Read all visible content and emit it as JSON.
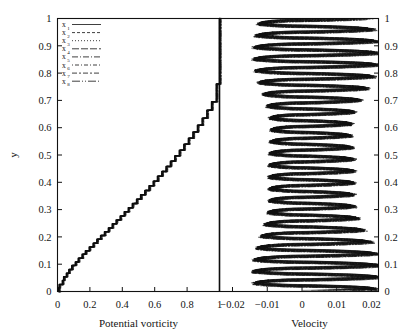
{
  "figure": {
    "y_axis_label": "y",
    "left_panel": {
      "x_axis_label": "Potential vorticity",
      "x_ticks": [
        "0",
        "0.2",
        "0.4",
        "0.6",
        "0.8",
        "1"
      ],
      "x_tick_values": [
        0,
        0.2,
        0.4,
        0.6,
        0.8,
        1
      ]
    },
    "right_panel": {
      "x_axis_label": "Velocity",
      "x_ticks": [
        "−0.02",
        "−0.01",
        "0",
        "0.01",
        "0.02"
      ],
      "x_tick_values": [
        -0.02,
        -0.01,
        0,
        0.01,
        0.02
      ]
    },
    "y_ticks": [
      "0",
      "0.1",
      "0.2",
      "0.3",
      "0.4",
      "0.5",
      "0.6",
      "0.7",
      "0.8",
      "0.9",
      "1"
    ],
    "y_tick_values": [
      0,
      0.1,
      0.2,
      0.3,
      0.4,
      0.5,
      0.6,
      0.7,
      0.8,
      0.9,
      1
    ]
  },
  "legend": {
    "entries": [
      {
        "label": "x",
        "sub": "1",
        "dash": "none"
      },
      {
        "label": "x",
        "sub": "2",
        "dash": "3,2"
      },
      {
        "label": "x",
        "sub": "3",
        "dash": "1,2"
      },
      {
        "label": "x",
        "sub": "4",
        "dash": "7,2"
      },
      {
        "label": "x",
        "sub": "5",
        "dash": "6,2,1,2"
      },
      {
        "label": "x",
        "sub": "6",
        "dash": "1,2,4,2"
      },
      {
        "label": "x",
        "sub": "7",
        "dash": "5,2,2,2"
      },
      {
        "label": "x",
        "sub": "8",
        "dash": "8,2,1,2,1,2"
      }
    ]
  },
  "chart_data": {
    "type": "line",
    "title": "",
    "panels": [
      {
        "name": "potential-vorticity",
        "xlabel": "Potential vorticity",
        "ylabel": "y",
        "xlim": [
          0,
          1
        ],
        "ylim": [
          0,
          1
        ],
        "grid": false,
        "description": "Monotonic staircase profile rising from near 0 at y=0 to 1 at y=1, with a small hook near the origin; superposed curves for x1..x8 nearly coincide.",
        "series": [
          {
            "name": "x1..x8 (coincident staircase)",
            "x": [
              0.012,
              0.006,
              0.004,
              0.01,
              0.022,
              0.03,
              0.031,
              0.038,
              0.046,
              0.055,
              0.06,
              0.07,
              0.08,
              0.088,
              0.098,
              0.11,
              0.12,
              0.128,
              0.14,
              0.152,
              0.162,
              0.172,
              0.185,
              0.196,
              0.208,
              0.22,
              0.23,
              0.243,
              0.255,
              0.266,
              0.278,
              0.29,
              0.302,
              0.314,
              0.326,
              0.338,
              0.35,
              0.362,
              0.374,
              0.387,
              0.399,
              0.412,
              0.424,
              0.437,
              0.45,
              0.462,
              0.475,
              0.488,
              0.5,
              0.513,
              0.526,
              0.539,
              0.552,
              0.565,
              0.578,
              0.591,
              0.604,
              0.617,
              0.63,
              0.644,
              0.657,
              0.67,
              0.684,
              0.697,
              0.711,
              0.724,
              0.738,
              0.752,
              0.766,
              0.78,
              0.794,
              0.808,
              0.822,
              0.836,
              0.85,
              0.864,
              0.879,
              0.893,
              0.908,
              0.922,
              0.937,
              0.951,
              0.966,
              0.98,
              0.993,
              1.0
            ],
            "y": [
              0.0,
              0.006,
              0.013,
              0.02,
              0.026,
              0.033,
              0.04,
              0.047,
              0.054,
              0.06,
              0.067,
              0.074,
              0.081,
              0.088,
              0.095,
              0.101,
              0.108,
              0.115,
              0.122,
              0.129,
              0.136,
              0.142,
              0.149,
              0.156,
              0.163,
              0.17,
              0.177,
              0.184,
              0.191,
              0.198,
              0.205,
              0.212,
              0.219,
              0.226,
              0.233,
              0.24,
              0.248,
              0.255,
              0.262,
              0.269,
              0.277,
              0.284,
              0.292,
              0.299,
              0.307,
              0.315,
              0.322,
              0.33,
              0.338,
              0.346,
              0.354,
              0.362,
              0.37,
              0.379,
              0.387,
              0.396,
              0.404,
              0.413,
              0.422,
              0.431,
              0.44,
              0.449,
              0.458,
              0.468,
              0.477,
              0.487,
              0.497,
              0.507,
              0.517,
              0.528,
              0.539,
              0.55,
              0.561,
              0.572,
              0.584,
              0.596,
              0.609,
              0.622,
              0.635,
              0.649,
              0.664,
              0.679,
              0.695,
              0.713,
              0.76,
              1.0
            ]
          }
        ],
        "annotations": [
          {
            "type": "vline",
            "x": 1.0,
            "note": "vertical boundary line at potential vorticity = 1"
          }
        ]
      },
      {
        "name": "velocity",
        "xlabel": "Velocity",
        "ylabel": "y",
        "xlim": [
          -0.02,
          0.022
        ],
        "ylim": [
          0,
          1
        ],
        "grid": false,
        "description": "Eight near-coincident velocity profiles x1..x8 oscillating rapidly in y, forming roughly 23 horizontal lens/wedge lobes. Each lobe has a sharp negative excursion near -0.012 and a broad positive tail extending to about +0.021.",
        "lobe_count": 23,
        "neg_peak": -0.013,
        "pos_peak": 0.021,
        "series": [
          {
            "name": "x1",
            "dash": "none"
          },
          {
            "name": "x2",
            "dash": "3,2"
          },
          {
            "name": "x3",
            "dash": "1,2"
          },
          {
            "name": "x4",
            "dash": "7,2"
          },
          {
            "name": "x5",
            "dash": "6,2,1,2"
          },
          {
            "name": "x6",
            "dash": "1,2,4,2"
          },
          {
            "name": "x7",
            "dash": "5,2,2,2"
          },
          {
            "name": "x8",
            "dash": "8,2,1,2,1,2"
          }
        ]
      }
    ]
  }
}
